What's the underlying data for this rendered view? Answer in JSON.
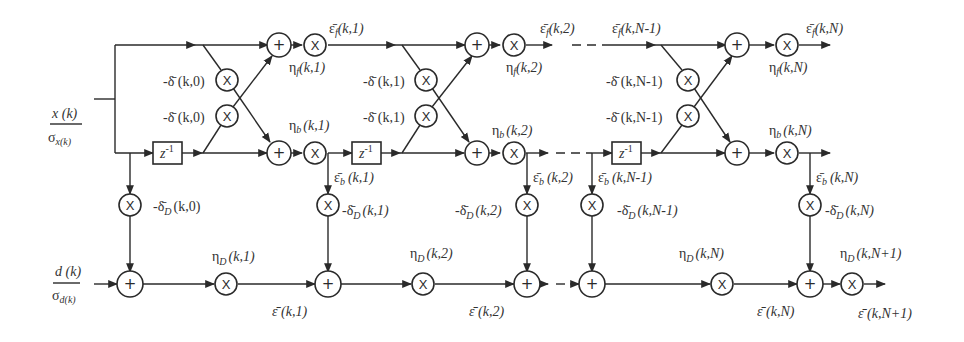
{
  "diagram": {
    "type": "normalized lattice joint-process estimator signal-flow graph",
    "inputs": {
      "x_num": "x (k)",
      "x_den": "σ",
      "x_den_sub": "x(k)",
      "d_num": "d (k)",
      "d_den": "σ",
      "d_den_sub": "d(k)"
    },
    "symbols": {
      "adder": "+",
      "multiplier": "X",
      "delay": "z",
      "delay_exp": "-1"
    },
    "stages": [
      {
        "index": "0",
        "delta_top": "-δ̄ (k,0)",
        "delta_bottom": "-δ̄ (k,0)",
        "delta_D": "-δ̄",
        "delta_D_sub": "D",
        "delta_D_args": "(k,0)"
      },
      {
        "index": "1",
        "eps_f": "ε̄",
        "eps_f_sub": "f",
        "eps_f_args": "(k,1)",
        "eta_f": "η",
        "eta_f_sub": "f",
        "eta_f_args": "(k,1)",
        "eta_b": "η",
        "eta_b_sub": "b",
        "eta_b_args": "(k,1)",
        "eps_b": "ε̄",
        "eps_b_sub": "b",
        "eps_b_args": "(k,1)",
        "delta_top": "-δ̄ (k,1)",
        "delta_bottom": "-δ̄ (k,1)",
        "delta_D": "-δ̄",
        "delta_D_sub": "D",
        "delta_D_args": "(k,1)",
        "eta_D": "η",
        "eta_D_sub": "D",
        "eta_D_args": "(k,1)",
        "eps": "ε̄ (k,1)"
      },
      {
        "index": "2",
        "eps_f": "ε̄",
        "eps_f_sub": "f",
        "eps_f_args": "(k,2)",
        "eta_f": "η",
        "eta_f_sub": "f",
        "eta_f_args": "(k,2)",
        "eta_b": "η",
        "eta_b_sub": "b",
        "eta_b_args": "(k,2)",
        "eps_b": "ε̄",
        "eps_b_sub": "b",
        "eps_b_args": "(k,2)",
        "delta_D": "-δ̄",
        "delta_D_sub": "D",
        "delta_D_args": "(k,2)",
        "eta_D": "η",
        "eta_D_sub": "D",
        "eta_D_args": "(k,2)",
        "eps": "ε̄ (k,2)"
      },
      {
        "index": "N-1",
        "eps_f": "ε̄",
        "eps_f_sub": "f",
        "eps_f_args": "(k,N-1)",
        "eps_b": "ε̄",
        "eps_b_sub": "b",
        "eps_b_args": "(k,N-1)",
        "delta_top": "-δ̄ (k,N-1)",
        "delta_bottom": "-δ̄ (k,N-1)",
        "delta_D": "-δ̄",
        "delta_D_sub": "D",
        "delta_D_args": "(k,N-1)"
      },
      {
        "index": "N",
        "eps_f": "ε̄",
        "eps_f_sub": "f",
        "eps_f_args": "(k,N)",
        "eta_f": "η",
        "eta_f_sub": "f",
        "eta_f_args": "(k,N)",
        "eta_b": "η",
        "eta_b_sub": "b",
        "eta_b_args": "(k,N)",
        "eps_b": "ε̄",
        "eps_b_sub": "b",
        "eps_b_args": "(k,N)",
        "delta_D": "-δ̄",
        "delta_D_sub": "D",
        "delta_D_args": "(k,N)",
        "eta_D": "η",
        "eta_D_sub": "D",
        "eta_D_args": "(k,N)",
        "eps": "ε̄ (k,N)"
      },
      {
        "index": "N+1",
        "eta_D": "η",
        "eta_D_sub": "D",
        "eta_D_args": "(k,N+1)",
        "eps": "ε̄ (k,N+1)"
      }
    ]
  }
}
